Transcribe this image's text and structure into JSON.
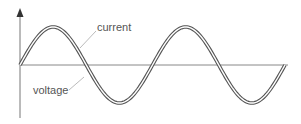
{
  "diagram": {
    "title": "",
    "labels": {
      "current": "current",
      "voltage": "voltage"
    },
    "waveforms": [
      {
        "name": "current",
        "type": "sine",
        "cycles": 2,
        "phase_deg": 0
      },
      {
        "name": "voltage",
        "type": "sine",
        "cycles": 2,
        "phase_deg": 0
      }
    ],
    "note": "voltage and current in phase",
    "colors": {
      "axis": "#777777",
      "wave_outline": "#555555",
      "wave_fill": "#ffffff",
      "text": "#555555",
      "leader": "#bbbbbb"
    }
  }
}
